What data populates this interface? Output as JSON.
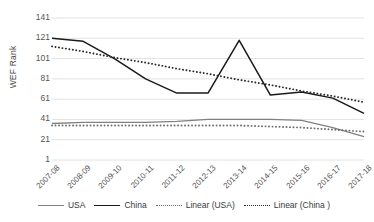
{
  "chart_data": {
    "type": "line",
    "title": "",
    "xlabel": "",
    "ylabel": "WEF Rank",
    "categories": [
      "2007-08",
      "2008-09",
      "2009-10",
      "2010-11",
      "2011-12",
      "2012-13",
      "2013-14",
      "2014-15",
      "2015-16",
      "2016-17",
      "2017-18"
    ],
    "yticks": [
      1,
      21,
      41,
      61,
      81,
      101,
      121,
      141
    ],
    "ylim": [
      1,
      141
    ],
    "grid": true,
    "legend_position": "bottom",
    "series": [
      {
        "name": "USA",
        "style": "solid",
        "color": "#808080",
        "values": [
          37,
          38,
          38,
          38,
          39,
          41,
          41,
          41,
          40,
          33,
          24
        ]
      },
      {
        "name": "China",
        "style": "solid",
        "color": "#1a1a1a",
        "values": [
          121,
          118,
          101,
          81,
          67,
          67,
          119,
          65,
          68,
          62,
          47
        ]
      },
      {
        "name": "Linear (USA)",
        "style": "dotted",
        "color": "#6f6f6f",
        "values": [
          35,
          35,
          35,
          35,
          35,
          35,
          35,
          34,
          33,
          31,
          29
        ]
      },
      {
        "name": "Linear (China )",
        "style": "dotted",
        "color": "#2b2b2b",
        "values": [
          113,
          108,
          102,
          97,
          91,
          86,
          80,
          75,
          69,
          64,
          58
        ]
      }
    ]
  },
  "axis": {
    "y_title": "WEF Rank",
    "y_tick_labels": [
      "141",
      "121",
      "101",
      "81",
      "61",
      "41",
      "21",
      "1"
    ],
    "x_tick_labels": [
      "2007-08",
      "2008-09",
      "2009-10",
      "2010-11",
      "2011-12",
      "2012-13",
      "2013-14",
      "2014-15",
      "2015-16",
      "2016-17",
      "2017-18"
    ]
  },
  "legend": {
    "items": [
      {
        "label": "USA",
        "key": "solid-usa"
      },
      {
        "label": "China",
        "key": "solid-china"
      },
      {
        "label": "Linear (USA)",
        "key": "dot-usa"
      },
      {
        "label": "Linear (China )",
        "key": "dot-china"
      }
    ]
  },
  "colors": {
    "usa": "#808080",
    "china": "#1a1a1a",
    "trend_usa": "#6f6f6f",
    "trend_china": "#2b2b2b",
    "grid": "#e2e2e2",
    "text": "#555555"
  }
}
